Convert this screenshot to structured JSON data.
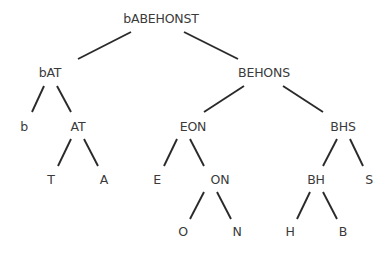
{
  "tree": {
    "nodes": [
      {
        "id": "root",
        "label": "bABEHONST",
        "x": 161,
        "y": 19
      },
      {
        "id": "bAT",
        "label": "bAT",
        "x": 50,
        "y": 73
      },
      {
        "id": "BEHONS",
        "label": "BEHONS",
        "x": 264,
        "y": 73
      },
      {
        "id": "b",
        "label": "b",
        "x": 24,
        "y": 127
      },
      {
        "id": "AT",
        "label": "AT",
        "x": 78,
        "y": 127
      },
      {
        "id": "EON",
        "label": "EON",
        "x": 193,
        "y": 127
      },
      {
        "id": "BHS",
        "label": "BHS",
        "x": 343,
        "y": 127
      },
      {
        "id": "T",
        "label": "T",
        "x": 51,
        "y": 180
      },
      {
        "id": "A",
        "label": "A",
        "x": 104,
        "y": 180
      },
      {
        "id": "E",
        "label": "E",
        "x": 157,
        "y": 180
      },
      {
        "id": "ON",
        "label": "ON",
        "x": 220,
        "y": 180
      },
      {
        "id": "BH",
        "label": "BH",
        "x": 316,
        "y": 180
      },
      {
        "id": "S",
        "label": "S",
        "x": 369,
        "y": 180
      },
      {
        "id": "O",
        "label": "O",
        "x": 183,
        "y": 232
      },
      {
        "id": "N",
        "label": "N",
        "x": 237,
        "y": 232
      },
      {
        "id": "H",
        "label": "H",
        "x": 290,
        "y": 232
      },
      {
        "id": "B",
        "label": "B",
        "x": 343,
        "y": 232
      }
    ],
    "edges": [
      {
        "from": "root",
        "to": "bAT",
        "x1": 131,
        "y1": 32,
        "x2": 78,
        "y2": 59
      },
      {
        "from": "root",
        "to": "BEHONS",
        "x1": 184,
        "y1": 32,
        "x2": 238,
        "y2": 59
      },
      {
        "from": "bAT",
        "to": "b",
        "x1": 44,
        "y1": 86,
        "x2": 32,
        "y2": 112
      },
      {
        "from": "bAT",
        "to": "AT",
        "x1": 57,
        "y1": 86,
        "x2": 71,
        "y2": 112
      },
      {
        "from": "BEHONS",
        "to": "EON",
        "x1": 244,
        "y1": 86,
        "x2": 204,
        "y2": 112
      },
      {
        "from": "BEHONS",
        "to": "BHS",
        "x1": 283,
        "y1": 86,
        "x2": 323,
        "y2": 112
      },
      {
        "from": "AT",
        "to": "T",
        "x1": 71,
        "y1": 139,
        "x2": 58,
        "y2": 166
      },
      {
        "from": "AT",
        "to": "A",
        "x1": 84,
        "y1": 139,
        "x2": 98,
        "y2": 166
      },
      {
        "from": "EON",
        "to": "E",
        "x1": 177,
        "y1": 139,
        "x2": 164,
        "y2": 166
      },
      {
        "from": "EON",
        "to": "ON",
        "x1": 190,
        "y1": 139,
        "x2": 204,
        "y2": 166
      },
      {
        "from": "BHS",
        "to": "BH",
        "x1": 337,
        "y1": 139,
        "x2": 323,
        "y2": 166
      },
      {
        "from": "BHS",
        "to": "S",
        "x1": 350,
        "y1": 139,
        "x2": 363,
        "y2": 166
      },
      {
        "from": "ON",
        "to": "O",
        "x1": 204,
        "y1": 192,
        "x2": 190,
        "y2": 219
      },
      {
        "from": "ON",
        "to": "N",
        "x1": 217,
        "y1": 192,
        "x2": 231,
        "y2": 219
      },
      {
        "from": "BH",
        "to": "H",
        "x1": 310,
        "y1": 192,
        "x2": 297,
        "y2": 219
      },
      {
        "from": "BH",
        "to": "B",
        "x1": 323,
        "y1": 192,
        "x2": 337,
        "y2": 219
      }
    ]
  }
}
